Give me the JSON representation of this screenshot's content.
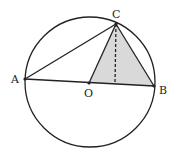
{
  "diagram": {
    "type": "geometry",
    "circle": {
      "center": "O",
      "cx": 90,
      "cy": 82,
      "r": 65
    },
    "points": {
      "A": {
        "label": "A",
        "x": 25,
        "y": 79
      },
      "B": {
        "label": "B",
        "x": 154,
        "y": 86
      },
      "C": {
        "label": "C",
        "x": 116,
        "y": 24
      },
      "O": {
        "label": "O",
        "x": 89,
        "y": 83
      },
      "H": {
        "x": 115,
        "y": 84
      }
    },
    "segments": [
      "AB",
      "AC",
      "BC",
      "OC"
    ],
    "dashed_segments": [
      "CH"
    ],
    "shaded_region": "triangle OBC",
    "colors": {
      "stroke": "#222222",
      "shade": "#d9d9d9",
      "background": "#ffffff"
    }
  }
}
